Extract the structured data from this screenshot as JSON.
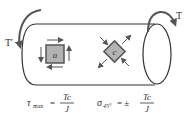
{
  "diagram": {
    "torque_left_label": "T'",
    "torque_right_label": "T",
    "element_a_label": "a",
    "element_c_label": "c",
    "formula_shear": {
      "lhs_symbol": "τ",
      "lhs_subscript": "max",
      "equals": "=",
      "numerator": "Tc",
      "denominator": "J"
    },
    "formula_normal": {
      "lhs_symbol": "σ",
      "lhs_subscript": "45°",
      "equals": "= ±",
      "numerator": "Tc",
      "denominator": "J"
    },
    "colors": {
      "element_fill": "#b3b3b3",
      "line": "#333333"
    }
  }
}
